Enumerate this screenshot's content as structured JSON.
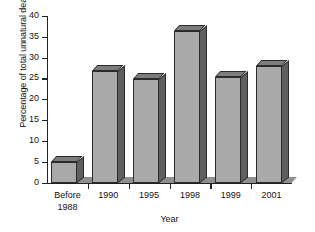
{
  "chart_data": {
    "type": "bar",
    "title": "",
    "xlabel": "Year",
    "ylabel": "Percentage of total unnatural deaths",
    "categories": [
      "Before 1988",
      "1990",
      "1995",
      "1998",
      "1999",
      "2001"
    ],
    "category_lines": [
      [
        "Before",
        "1988"
      ],
      [
        "1990"
      ],
      [
        "1995"
      ],
      [
        "1998"
      ],
      [
        "1999"
      ],
      [
        "2001"
      ]
    ],
    "values": [
      5,
      27,
      25,
      36.5,
      25.5,
      28
    ],
    "ylim": [
      0,
      40
    ],
    "ytick_labels": [
      "0",
      "5",
      "10",
      "15",
      "20",
      "25",
      "30",
      "35",
      "40"
    ],
    "ytick_values": [
      0,
      5,
      10,
      15,
      20,
      25,
      30,
      35,
      40
    ],
    "grid": false,
    "legend": "none",
    "style": "3d-column",
    "colors": {
      "bar_front": "#a9a9a9",
      "bar_side": "#5f5f5f",
      "bar_top": "#7d7d7d",
      "outline": "#2b2b2b",
      "floor": "#8f8f8f",
      "axis": "#222222",
      "text": "#111111",
      "background": "#ffffff"
    }
  }
}
